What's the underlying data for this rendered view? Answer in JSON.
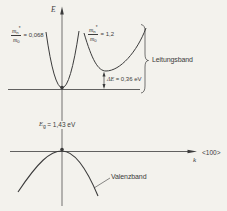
{
  "colors": {
    "background": "#f3f2ed",
    "ink": "#3b3b3b"
  },
  "diagram": {
    "energy_axis_label": "E",
    "k_axis_label": "k",
    "k_axis_direction": "<100>",
    "conduction_band_label": "Leitungsband",
    "valence_band_label": "Valenzband",
    "gamma_valley_mass": {
      "num": "m",
      "num_sub": "n",
      "star": "*",
      "den": "m",
      "den_sub": "0",
      "value": "= 0,068"
    },
    "satellite_valley_mass": {
      "num": "m",
      "num_sub": "n",
      "star": "*",
      "den": "m",
      "den_sub": "0",
      "value": "= 1,2"
    },
    "valley_separation": {
      "symbol": "ΔE",
      "value": "= 0,36 eV"
    },
    "band_gap": {
      "symbol": "E",
      "sub": "g",
      "value": "= 1,43 eV"
    }
  }
}
